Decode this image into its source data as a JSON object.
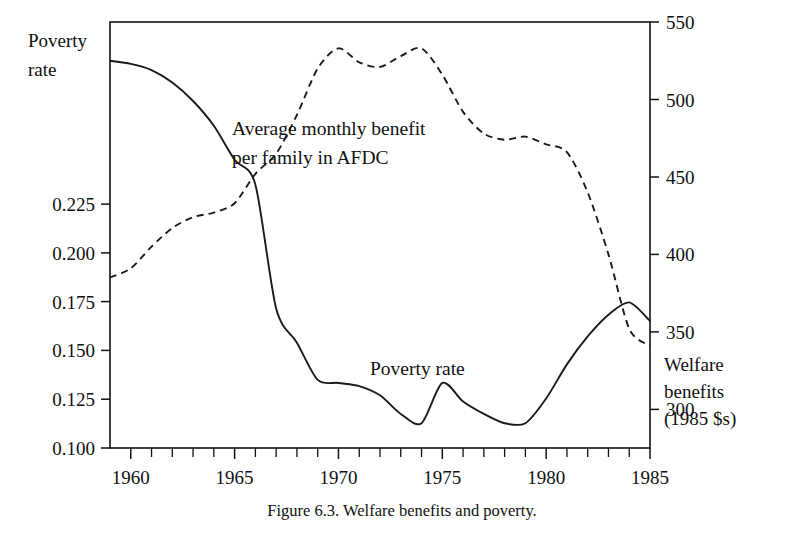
{
  "figure": {
    "caption": "Figure 6.3.  Welfare benefits and poverty.",
    "left_axis_title_line1": "Poverty",
    "left_axis_title_line2": "rate",
    "right_axis_title_line1": "Welfare",
    "right_axis_title_line2": "benefits",
    "right_axis_title_line3": "(1985 $s)",
    "annotation_benefits_line1": "Average monthly benefit",
    "annotation_benefits_line2": "per family in AFDC",
    "annotation_poverty": "Poverty rate"
  },
  "chart_data": {
    "type": "line",
    "title": "Figure 6.3.  Welfare benefits and poverty.",
    "xlabel": "",
    "ylabel": "Poverty rate",
    "y2label": "Welfare benefits (1985 $s)",
    "grid": false,
    "legend": "inline-annotations",
    "xlim": [
      1959,
      1985
    ],
    "ylim": [
      0.1,
      0.2375
    ],
    "y2lim": [
      275,
      550
    ],
    "xticks": [
      1960,
      1965,
      1970,
      1975,
      1980,
      1985
    ],
    "xtick_labels": [
      "1960",
      "1965",
      "1970",
      "1975",
      "1980",
      "1985"
    ],
    "xticks_minor_step": 1,
    "yticks": [
      0.1,
      0.125,
      0.15,
      0.175,
      0.2,
      0.225
    ],
    "ytick_labels": [
      "0.100",
      "0.125",
      "0.150",
      "0.175",
      "0.200",
      "0.225"
    ],
    "y2ticks": [
      300,
      350,
      400,
      450,
      500,
      550
    ],
    "y2tick_labels": [
      "300",
      "350",
      "400",
      "450",
      "500",
      "550"
    ],
    "series": [
      {
        "name": "Poverty rate",
        "axis": "left",
        "style": "solid",
        "x": [
          1959,
          1960,
          1961,
          1962,
          1963,
          1964,
          1965,
          1966,
          1967,
          1968,
          1969,
          1970,
          1971,
          1972,
          1973,
          1974,
          1975,
          1976,
          1977,
          1978,
          1979,
          1980,
          1981,
          1982,
          1983,
          1984,
          1985
        ],
        "values": [
          0.225,
          0.224,
          0.222,
          0.218,
          0.212,
          0.204,
          0.193,
          0.185,
          0.145,
          0.134,
          0.122,
          0.121,
          0.12,
          0.117,
          0.111,
          0.108,
          0.121,
          0.115,
          0.111,
          0.108,
          0.108,
          0.116,
          0.127,
          0.136,
          0.143,
          0.147,
          0.141
        ]
      },
      {
        "name": "Average monthly benefit per family in AFDC",
        "axis": "right",
        "style": "dashed",
        "x": [
          1959,
          1960,
          1961,
          1962,
          1963,
          1964,
          1965,
          1966,
          1967,
          1968,
          1969,
          1970,
          1971,
          1972,
          1973,
          1974,
          1975,
          1976,
          1977,
          1978,
          1979,
          1980,
          1981,
          1982,
          1983,
          1984,
          1985
        ],
        "values": [
          385,
          390,
          404,
          416,
          424,
          427,
          434,
          452,
          463,
          487,
          516,
          533,
          523,
          521,
          527,
          533,
          515,
          495,
          479,
          474,
          476,
          472,
          470,
          452,
          423,
          395,
          368
        ]
      }
    ],
    "series_corrections": {
      "note": "benefit values re-read from plot",
      "benefit_values": [
        385,
        391,
        405,
        417,
        424,
        427,
        433,
        452,
        465,
        490,
        520,
        533,
        524,
        521,
        528,
        533,
        516,
        492,
        478,
        474,
        476,
        471,
        466,
        440,
        400,
        352,
        341
      ]
    }
  }
}
